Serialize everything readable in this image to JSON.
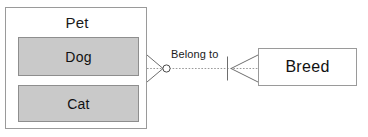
{
  "diagram": {
    "type": "entity-relationship-diagram",
    "notation": "crows-foot",
    "background_color": "#ffffff",
    "entities": [
      {
        "id": "pet",
        "label": "Pet",
        "role": "parent-container",
        "fill_color": "#ffffff",
        "border_color": "#9a9a9a",
        "children": [
          {
            "id": "dog",
            "label": "Dog",
            "fill_color": "#c9c9c9",
            "border_color": "#8e8e8e"
          },
          {
            "id": "cat",
            "label": "Cat",
            "fill_color": "#c9c9c9",
            "border_color": "#8e8e8e"
          }
        ]
      },
      {
        "id": "breed",
        "label": "Breed",
        "role": "entity",
        "fill_color": "#ffffff",
        "border_color": "#9a9a9a"
      }
    ],
    "relationship": {
      "label": "Belong to",
      "from": "Pet",
      "to": "Breed",
      "line_style": "dotted",
      "line_color": "#9a9a9a",
      "source_cardinality": "zero-or-many",
      "target_cardinality": "one-or-many"
    }
  }
}
